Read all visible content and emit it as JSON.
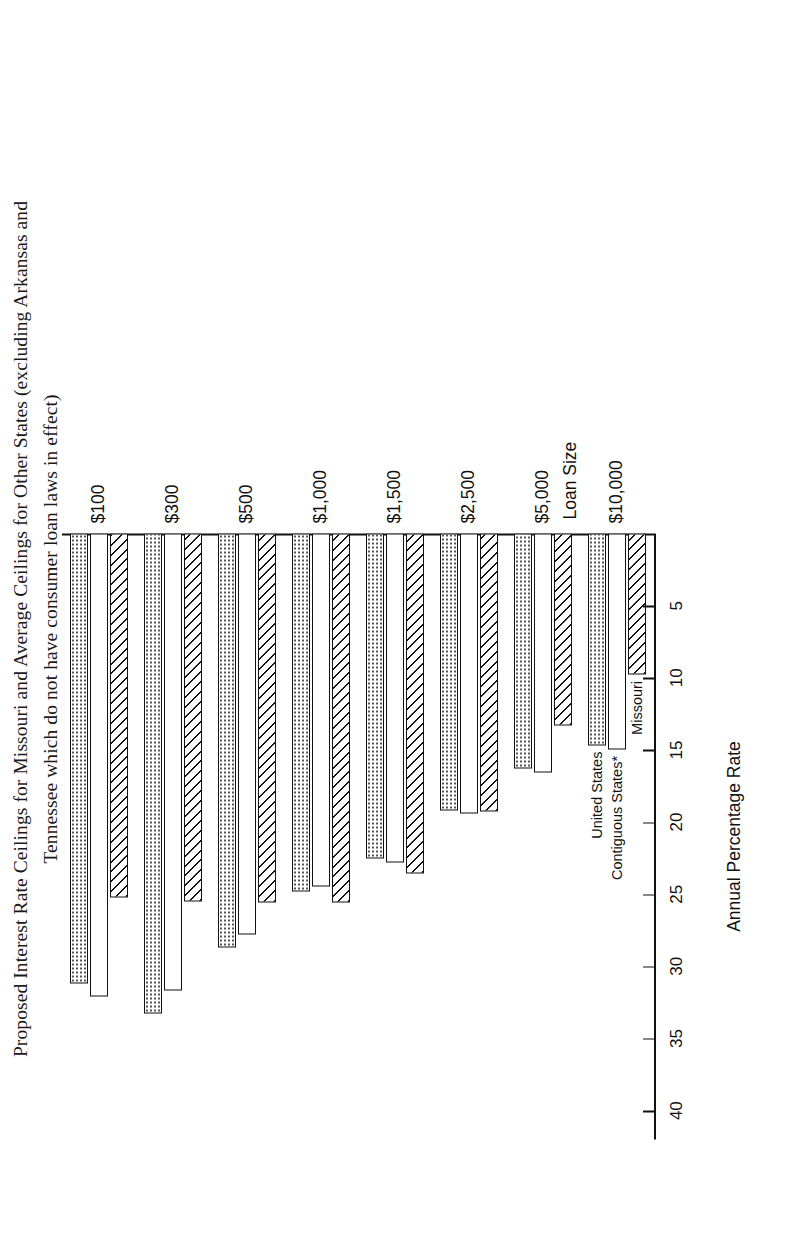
{
  "chart_data": {
    "type": "bar",
    "orientation": "horizontal",
    "title": "Proposed Interest Rate Ceilings for Missouri and Average Ceilings for Other States (excluding Arkansas and Tennessee which do not have consumer loan laws in effect)",
    "title_lines": [
      "Proposed Interest Rate Ceilings for Missouri and Average Ceilings for Other States (excluding Arkansas and",
      "Tennessee which do not have consumer loan laws in effect)"
    ],
    "xlabel": "Loan Size",
    "ylabel": "Annual Percentage Rate",
    "categories": [
      "$100",
      "$300",
      "$500",
      "$1,000",
      "$1,500",
      "$2,500",
      "$5,000",
      "$10,000"
    ],
    "ylim": [
      0,
      42
    ],
    "yticks": [
      5,
      10,
      15,
      20,
      25,
      30,
      35,
      40
    ],
    "ytick_labels": [
      "5",
      "10",
      "15",
      "20",
      "25",
      "30",
      "35",
      "40"
    ],
    "grid": false,
    "legend": "inline annotations at $10,000 group",
    "series": [
      {
        "name": "Missouri",
        "pattern": "diagonal-hatch",
        "values": [
          25.2,
          25.5,
          25.6,
          25.6,
          23.6,
          19.3,
          13.3,
          9.8
        ]
      },
      {
        "name": "Contiguous States*",
        "pattern": "white",
        "values": [
          32.1,
          31.7,
          27.8,
          24.5,
          22.8,
          19.4,
          16.6,
          15.0
        ]
      },
      {
        "name": "United States",
        "pattern": "dotted",
        "values": [
          31.2,
          33.3,
          28.7,
          24.8,
          22.5,
          19.2,
          16.3,
          14.7
        ]
      }
    ],
    "annotations": [
      "Missouri",
      "Contiguous States*",
      "United States"
    ]
  }
}
